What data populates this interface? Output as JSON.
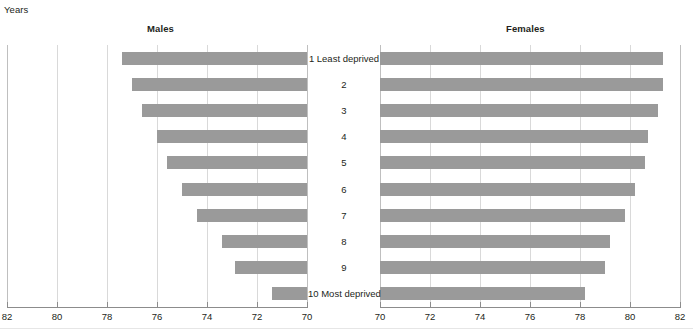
{
  "axis_unit_label": "Years",
  "panels": {
    "males": {
      "title": "Males"
    },
    "females": {
      "title": "Females"
    }
  },
  "colors": {
    "bar": "#9a9a9a",
    "gridline": "#d9d9d9",
    "axis": "#8c8c8c",
    "text": "#231f20"
  },
  "chart_data": {
    "type": "bar",
    "title": "",
    "subtitle": "",
    "orientation": "horizontal",
    "layout": "back-to-back population pyramid",
    "xlabel": "Years",
    "ylabel": "",
    "grid": true,
    "legend": "none",
    "categories": [
      "1 Least deprived",
      "2",
      "3",
      "4",
      "5",
      "6",
      "7",
      "8",
      "9",
      "10 Most deprived"
    ],
    "series": [
      {
        "name": "Males",
        "axis_side": "left",
        "axis_direction": "reversed",
        "xlim": [
          70,
          82
        ],
        "xticks": [
          82,
          80,
          78,
          76,
          74,
          72,
          70
        ],
        "baseline": 70,
        "values": [
          77.4,
          77.0,
          76.6,
          76.0,
          75.6,
          75.0,
          74.4,
          73.4,
          72.9,
          71.4
        ]
      },
      {
        "name": "Females",
        "axis_side": "right",
        "axis_direction": "normal",
        "xlim": [
          70,
          82
        ],
        "xticks": [
          70,
          72,
          74,
          76,
          78,
          80,
          82
        ],
        "baseline": 70,
        "values": [
          81.3,
          81.3,
          81.1,
          80.7,
          80.6,
          80.2,
          79.8,
          79.2,
          79.0,
          78.2
        ]
      }
    ]
  }
}
